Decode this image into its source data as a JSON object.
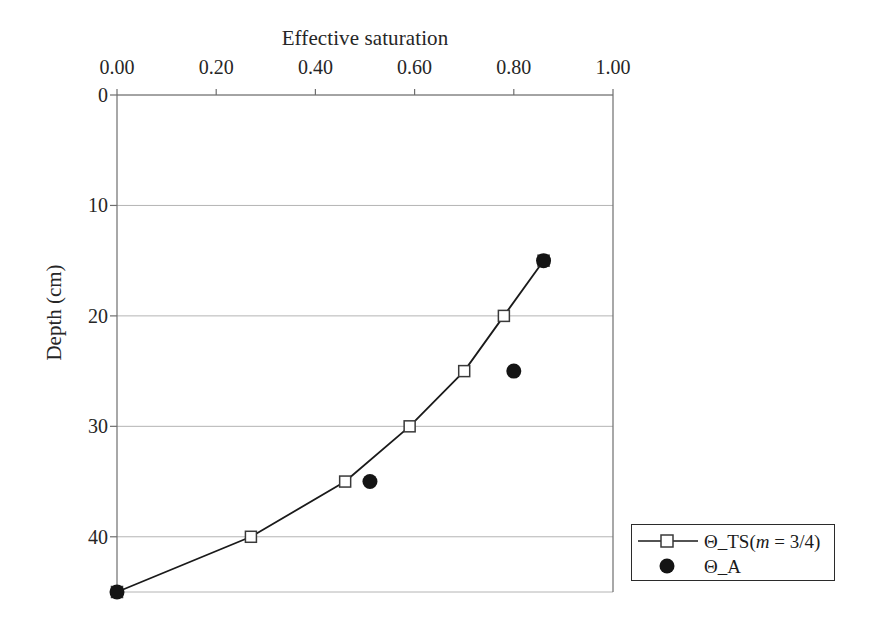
{
  "chart_data": {
    "type": "line",
    "title": "Effective saturation",
    "xlabel": "Effective saturation",
    "ylabel": "Depth (cm)",
    "xlim": [
      0.0,
      1.0
    ],
    "ylim": [
      0,
      45
    ],
    "y_inverted": true,
    "x_axis_position": "top",
    "grid": "horizontal",
    "legend_position": "bottom-right-outside",
    "x_ticks": [
      0.0,
      0.2,
      0.4,
      0.6,
      0.8,
      1.0
    ],
    "x_tick_labels": [
      "0.00",
      "0.20",
      "0.40",
      "0.60",
      "0.80",
      "1.00"
    ],
    "y_ticks": [
      0,
      10,
      20,
      30,
      40
    ],
    "y_tick_labels": [
      "0",
      "10",
      "20",
      "30",
      "40"
    ],
    "series": [
      {
        "name": "Θ_TS(m = 3/4)",
        "name_prefix": "Θ_TS(",
        "name_italic": "m",
        "name_suffix": " = 3/4)",
        "marker": "open-square",
        "line": "solid",
        "color": "#1a1a1a",
        "points": [
          {
            "x": 0.0,
            "y": 45
          },
          {
            "x": 0.27,
            "y": 40
          },
          {
            "x": 0.46,
            "y": 35
          },
          {
            "x": 0.59,
            "y": 30
          },
          {
            "x": 0.7,
            "y": 25
          },
          {
            "x": 0.78,
            "y": 20
          },
          {
            "x": 0.86,
            "y": 15
          }
        ]
      },
      {
        "name": "Θ_A",
        "marker": "filled-circle",
        "line": "none",
        "color": "#1a1a1a",
        "points": [
          {
            "x": 0.0,
            "y": 45
          },
          {
            "x": 0.51,
            "y": 35
          },
          {
            "x": 0.8,
            "y": 25
          },
          {
            "x": 0.86,
            "y": 15
          }
        ]
      }
    ]
  },
  "legend": {
    "entries": [
      {
        "label": "Θ_TS(m = 3/4)",
        "marker": "open-square"
      },
      {
        "label": "Θ_A",
        "marker": "filled-circle"
      }
    ]
  },
  "colors": {
    "axis": "#6e6e6e",
    "grid": "#b4b4b4",
    "series": "#1a1a1a",
    "text": "#262626",
    "background": "#ffffff"
  }
}
